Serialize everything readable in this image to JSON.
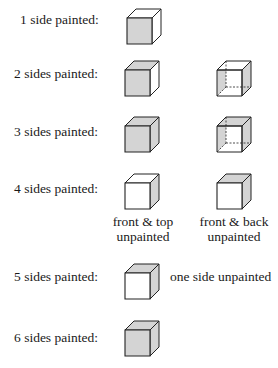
{
  "colors": {
    "paint": "#d4d4d4",
    "unpainted": "#ffffff",
    "edge": "#222222"
  },
  "rows": [
    {
      "label": "1 side painted:",
      "cubes": [
        {
          "id": "1a",
          "front": true,
          "top": false,
          "right": false,
          "transparent": false
        }
      ]
    },
    {
      "label": "2 sides painted:",
      "cubes": [
        {
          "id": "2a",
          "front": true,
          "top": true,
          "right": false,
          "transparent": false
        },
        {
          "id": "2b",
          "front": false,
          "top": false,
          "right": true,
          "left_back": true,
          "transparent": true
        }
      ]
    },
    {
      "label": "3 sides painted:",
      "cubes": [
        {
          "id": "3a",
          "front": true,
          "top": true,
          "right": true,
          "transparent": false
        },
        {
          "id": "3b",
          "front": false,
          "top": true,
          "right": true,
          "left_back": true,
          "transparent": true
        }
      ]
    },
    {
      "label": "4 sides painted:",
      "cubes": [
        {
          "id": "4a",
          "front": false,
          "top": false,
          "right": true,
          "transparent": false,
          "caption": [
            "front & top",
            "unpainted"
          ]
        },
        {
          "id": "4b",
          "front": false,
          "top": true,
          "right": true,
          "transparent": false,
          "caption": [
            "front & back",
            "unpainted"
          ]
        }
      ]
    },
    {
      "label": "5 sides painted:",
      "cubes": [
        {
          "id": "5a",
          "front": false,
          "top": true,
          "right": true,
          "transparent": false
        }
      ],
      "note": "one side unpainted"
    },
    {
      "label": "6 sides painted:",
      "cubes": [
        {
          "id": "6a",
          "front": true,
          "top": true,
          "right": true,
          "transparent": false
        }
      ]
    }
  ]
}
